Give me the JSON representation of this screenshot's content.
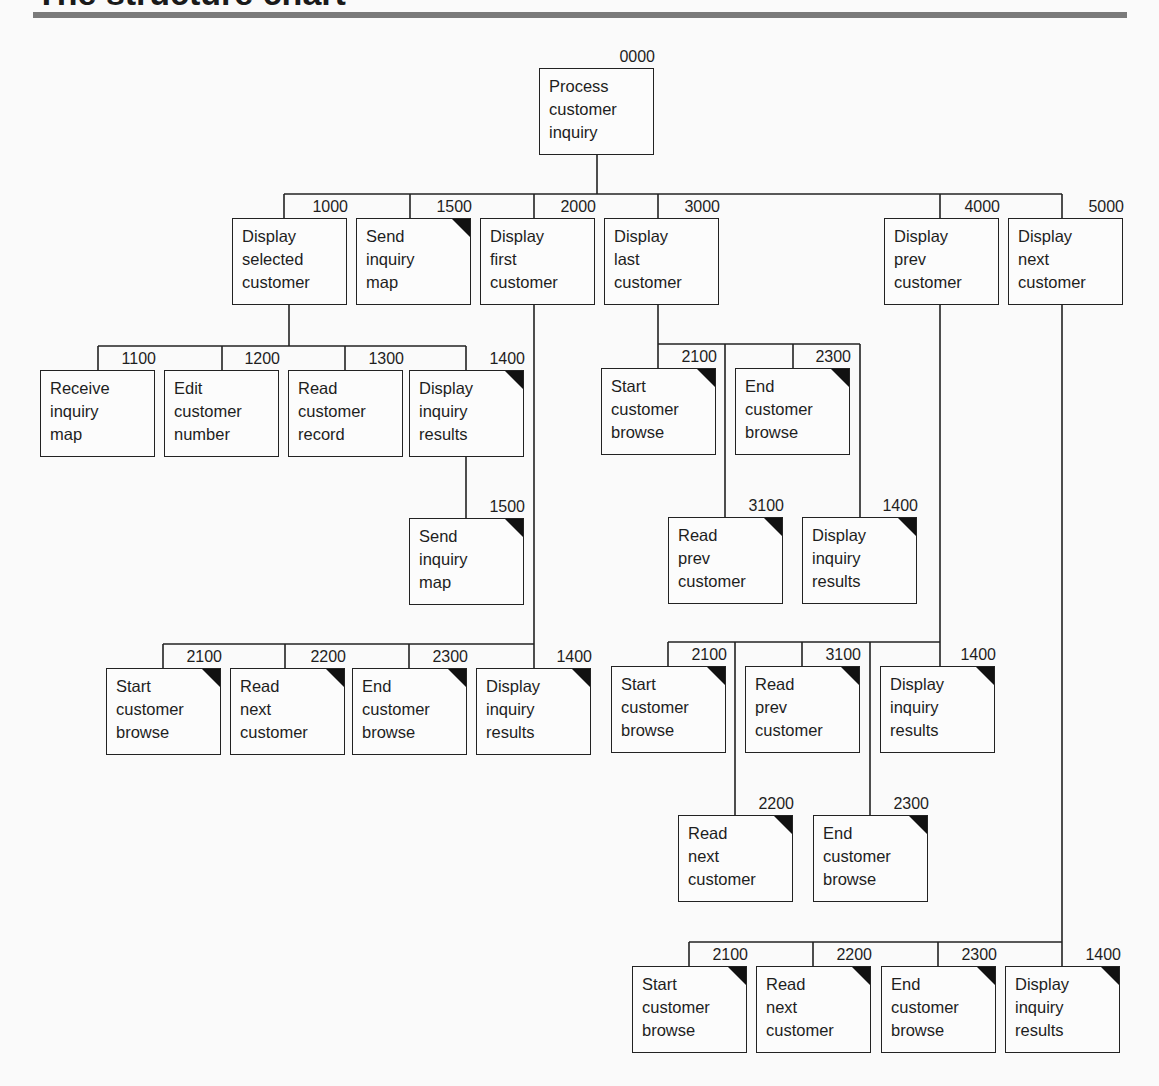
{
  "page": {
    "title": "The structure chart"
  },
  "chart_data": {
    "type": "structure_chart",
    "title": "The structure chart",
    "root": "0000",
    "legend_note": "Black corner triangle marks a common (reused) module",
    "edges": [
      [
        "0000",
        "1000"
      ],
      [
        "0000",
        "1500"
      ],
      [
        "0000",
        "2000"
      ],
      [
        "0000",
        "3000"
      ],
      [
        "0000",
        "4000"
      ],
      [
        "0000",
        "5000"
      ],
      [
        "1000",
        "1100"
      ],
      [
        "1000",
        "1200"
      ],
      [
        "1000",
        "1300"
      ],
      [
        "1000",
        "1400"
      ],
      [
        "1400",
        "1500"
      ],
      [
        "2000",
        "2100"
      ],
      [
        "2000",
        "2200"
      ],
      [
        "2000",
        "2300"
      ],
      [
        "2000",
        "1400"
      ],
      [
        "3000",
        "2100"
      ],
      [
        "3000",
        "3100"
      ],
      [
        "3000",
        "2300"
      ],
      [
        "3000",
        "1400"
      ],
      [
        "4000",
        "2100"
      ],
      [
        "4000",
        "2200"
      ],
      [
        "4000",
        "3100"
      ],
      [
        "4000",
        "2300"
      ],
      [
        "4000",
        "1400"
      ],
      [
        "5000",
        "2100"
      ],
      [
        "5000",
        "2200"
      ],
      [
        "5000",
        "2300"
      ],
      [
        "5000",
        "1400"
      ]
    ]
  },
  "modules": [
    {
      "id": "n0000",
      "num": "0000",
      "lines": [
        "Process",
        "customer",
        "inquiry"
      ],
      "common": false
    },
    {
      "id": "n1000",
      "num": "1000",
      "lines": [
        "Display",
        "selected",
        "customer"
      ],
      "common": false
    },
    {
      "id": "n1500a",
      "num": "1500",
      "lines": [
        "Send",
        "inquiry",
        "map"
      ],
      "common": true
    },
    {
      "id": "n2000",
      "num": "2000",
      "lines": [
        "Display",
        "first",
        "customer"
      ],
      "common": false
    },
    {
      "id": "n3000",
      "num": "3000",
      "lines": [
        "Display",
        "last",
        "customer"
      ],
      "common": false
    },
    {
      "id": "n4000",
      "num": "4000",
      "lines": [
        "Display",
        "prev",
        "customer"
      ],
      "common": false
    },
    {
      "id": "n5000",
      "num": "5000",
      "lines": [
        "Display",
        "next",
        "customer"
      ],
      "common": false
    },
    {
      "id": "n1100",
      "num": "1100",
      "lines": [
        "Receive",
        "inquiry",
        "map"
      ],
      "common": false
    },
    {
      "id": "n1200",
      "num": "1200",
      "lines": [
        "Edit",
        "customer",
        "number"
      ],
      "common": false
    },
    {
      "id": "n1300",
      "num": "1300",
      "lines": [
        "Read",
        "customer",
        "record"
      ],
      "common": false
    },
    {
      "id": "n1400a",
      "num": "1400",
      "lines": [
        "Display",
        "inquiry",
        "results"
      ],
      "common": true
    },
    {
      "id": "n1500b",
      "num": "1500",
      "lines": [
        "Send",
        "inquiry",
        "map"
      ],
      "common": true
    },
    {
      "id": "n2100a",
      "num": "2100",
      "lines": [
        "Start",
        "customer",
        "browse"
      ],
      "common": true
    },
    {
      "id": "n2200a",
      "num": "2200",
      "lines": [
        "Read",
        "next",
        "customer"
      ],
      "common": true
    },
    {
      "id": "n2300a",
      "num": "2300",
      "lines": [
        "End",
        "customer",
        "browse"
      ],
      "common": true
    },
    {
      "id": "n1400b",
      "num": "1400",
      "lines": [
        "Display",
        "inquiry",
        "results"
      ],
      "common": true
    },
    {
      "id": "n2100b",
      "num": "2100",
      "lines": [
        "Start",
        "customer",
        "browse"
      ],
      "common": true
    },
    {
      "id": "n2300b",
      "num": "2300",
      "lines": [
        "End",
        "customer",
        "browse"
      ],
      "common": true
    },
    {
      "id": "n3100a",
      "num": "3100",
      "lines": [
        "Read",
        "prev",
        "customer"
      ],
      "common": true
    },
    {
      "id": "n1400c",
      "num": "1400",
      "lines": [
        "Display",
        "inquiry",
        "results"
      ],
      "common": true
    },
    {
      "id": "n2100c",
      "num": "2100",
      "lines": [
        "Start",
        "customer",
        "browse"
      ],
      "common": true
    },
    {
      "id": "n3100b",
      "num": "3100",
      "lines": [
        "Read",
        "prev",
        "customer"
      ],
      "common": true
    },
    {
      "id": "n1400d",
      "num": "1400",
      "lines": [
        "Display",
        "inquiry",
        "results"
      ],
      "common": true
    },
    {
      "id": "n2200b",
      "num": "2200",
      "lines": [
        "Read",
        "next",
        "customer"
      ],
      "common": true
    },
    {
      "id": "n2300c",
      "num": "2300",
      "lines": [
        "End",
        "customer",
        "browse"
      ],
      "common": true
    },
    {
      "id": "n2100d",
      "num": "2100",
      "lines": [
        "Start",
        "customer",
        "browse"
      ],
      "common": true
    },
    {
      "id": "n2200c",
      "num": "2200",
      "lines": [
        "Read",
        "next",
        "customer"
      ],
      "common": true
    },
    {
      "id": "n2300d",
      "num": "2300",
      "lines": [
        "End",
        "customer",
        "browse"
      ],
      "common": true
    },
    {
      "id": "n1400e",
      "num": "1400",
      "lines": [
        "Display",
        "inquiry",
        "results"
      ],
      "common": true
    }
  ]
}
